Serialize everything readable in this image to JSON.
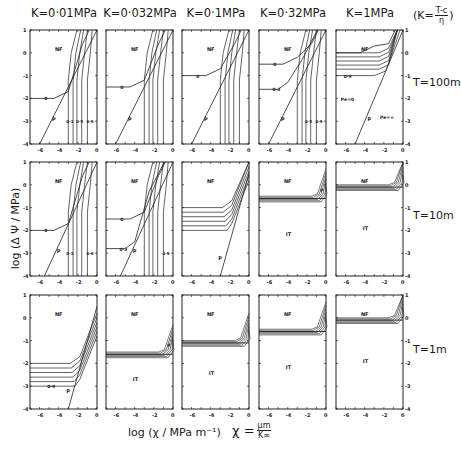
{
  "figure": {
    "column_titles": [
      "K=0·01MPa",
      "K=0·032MPa",
      "K=0·1MPa",
      "K=0·32MPa",
      "K=1MPa"
    ],
    "k_definition": {
      "prefix": "(K=",
      "numerator": "T-c",
      "denominator": "η",
      "suffix": ")"
    },
    "row_labels": [
      "T=100m",
      "T=10m",
      "T=1m"
    ],
    "y_axis_label": "log (Δ Ψ / MPa)",
    "x_axis_label": "log (χ / MPa m⁻¹)",
    "chi_definition": {
      "lhs": "χ =",
      "numerator": "μm",
      "denominator": "K∞"
    },
    "region_labels": {
      "nf": "NF",
      "it": "IT",
      "p": "P"
    },
    "pe_labels": [
      "Pe=0",
      "Pe=∞"
    ]
  },
  "chart_data": {
    "type": "line",
    "xlabel": "log (χ/MPa m⁻¹)",
    "ylabel": "log (ΔΨ/MPa)",
    "xlim": [
      -7,
      0
    ],
    "ylim": [
      -4,
      1
    ],
    "x_ticks": [
      -6,
      -4,
      -2,
      0
    ],
    "y_ticks": [
      -4,
      -3,
      -2,
      -1,
      0,
      1
    ],
    "grid": false,
    "columns_K_MPa": [
      0.01,
      0.032,
      0.1,
      0.32,
      1
    ],
    "rows_T_m": [
      100,
      10,
      1
    ],
    "panels": [
      {
        "row": "T=100m",
        "K": "0·01MPa",
        "labels": [
          "NF",
          "0",
          "P",
          "0·1",
          "0·5",
          "0·9"
        ],
        "plateau_logDPsi_at_0": -2.0,
        "P_line": [
          [
            -6,
            -4
          ],
          [
            0,
            1
          ]
        ]
      },
      {
        "row": "T=100m",
        "K": "0·032MPa",
        "labels": [
          "NF",
          "0",
          "P"
        ],
        "plateau_logDPsi_at_0": -1.5,
        "P_line": [
          [
            -6,
            -4
          ],
          [
            0,
            1
          ]
        ]
      },
      {
        "row": "T=100m",
        "K": "0·1MPa",
        "labels": [
          "NF",
          "0",
          "P"
        ],
        "plateau_logDPsi_at_0": -1.0,
        "P_line": [
          [
            -6,
            -4
          ],
          [
            0,
            1
          ]
        ]
      },
      {
        "row": "T=100m",
        "K": "0·32MPa",
        "labels": [
          "NF",
          "0",
          "0·3",
          "P",
          "0·5",
          "0·9"
        ],
        "plateau_logDPsi_at_0": -0.5,
        "plateau_logDPsi_at_0_3": -1.6,
        "P_line": [
          [
            -6,
            -4
          ],
          [
            0,
            1
          ]
        ]
      },
      {
        "row": "T=100m",
        "K": "1MPa",
        "labels": [
          "NF",
          "0·9",
          "P",
          "Pe=0",
          "Pe=∞"
        ],
        "plateau_logDPsi_top": 0.0,
        "plateau_logDPsi_0_9": -1.0,
        "P_line": [
          [
            -5,
            -4
          ],
          [
            0,
            1
          ]
        ]
      },
      {
        "row": "T=10m",
        "K": "0·01MPa",
        "labels": [
          "NF",
          "0",
          "P",
          "0·1",
          "0·9"
        ],
        "plateau_logDPsi_at_0": -2.0
      },
      {
        "row": "T=10m",
        "K": "0·032MPa",
        "labels": [
          "NF",
          "0",
          "0·3",
          "P",
          "0·9"
        ],
        "plateau_logDPsi_at_0": -1.5,
        "plateau_logDPsi_at_0_3": -2.8
      },
      {
        "row": "T=10m",
        "K": "0·1MPa",
        "labels": [
          "NF",
          "P"
        ],
        "plateau_logDPsi_range": [
          -2.0,
          -1.0
        ]
      },
      {
        "row": "T=10m",
        "K": "0·32MPa",
        "labels": [
          "NF",
          "IT",
          "P"
        ],
        "plateau_logDPsi": -0.5
      },
      {
        "row": "T=10m",
        "K": "1MPa",
        "labels": [
          "NF",
          "IT"
        ],
        "plateau_logDPsi": 0.0
      },
      {
        "row": "T=1m",
        "K": "0·01MPa",
        "labels": [
          "NF",
          "0·9",
          "P"
        ],
        "plateau_logDPsi_range": [
          -3.0,
          -2.0
        ]
      },
      {
        "row": "T=1m",
        "K": "0·032MPa",
        "labels": [
          "NF",
          "IT",
          "P"
        ],
        "plateau_logDPsi": -1.5
      },
      {
        "row": "T=1m",
        "K": "0·1MPa",
        "labels": [
          "NF",
          "IT"
        ],
        "plateau_logDPsi": -1.0
      },
      {
        "row": "T=1m",
        "K": "0·32MPa",
        "labels": [
          "NF",
          "IT"
        ],
        "plateau_logDPsi": -0.5
      },
      {
        "row": "T=1m",
        "K": "1MPa",
        "labels": [
          "NF",
          "IT"
        ],
        "plateau_logDPsi": 0.0
      }
    ]
  }
}
